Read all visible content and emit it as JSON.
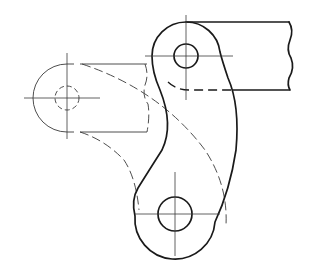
{
  "drawing": {
    "type": "mechanical-linkage-sketch",
    "description": "Curved lever link with two pivot holes, attached to a rectangular bar with a break line; phantom (dashed) alternate position shown at left",
    "colors": {
      "background": "#ffffff",
      "line": "#1a1a1a",
      "thin_line": "#3a3a3a"
    },
    "parts": {
      "upper_pivot": {
        "cx": 186,
        "cy": 56,
        "hole_r": 12,
        "boss_r": 34
      },
      "lower_pivot": {
        "cx": 175,
        "cy": 214,
        "hole_r": 17,
        "boss_r": 40
      },
      "bar": {
        "top_y": 22,
        "bottom_y": 90,
        "right_x": 290
      },
      "phantom_position": {
        "cx": 67,
        "cy": 98,
        "hole_r": 12,
        "boss_r": 34,
        "right_x": 147
      }
    }
  }
}
